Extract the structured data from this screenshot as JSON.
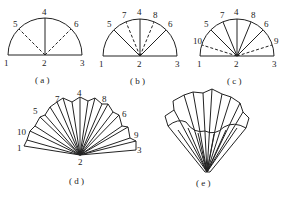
{
  "figure": {
    "panels": [
      {
        "id": "a",
        "caption": "( a )",
        "points": [
          "1",
          "2",
          "3",
          "4",
          "5",
          "6"
        ]
      },
      {
        "id": "b",
        "caption": "( b )",
        "points": [
          "1",
          "2",
          "3",
          "4",
          "5",
          "6",
          "7",
          "8"
        ]
      },
      {
        "id": "c",
        "caption": "( c )",
        "points": [
          "1",
          "2",
          "3",
          "4",
          "5",
          "6",
          "7",
          "8",
          "9",
          "10"
        ]
      },
      {
        "id": "d",
        "caption": "( d )",
        "points": [
          "1",
          "2",
          "3",
          "4",
          "5",
          "6",
          "7",
          "8",
          "9",
          "10"
        ]
      },
      {
        "id": "e",
        "caption": "( e )"
      }
    ],
    "labels": {
      "a": {
        "p1": "1",
        "p2": "2",
        "p3": "3",
        "p4": "4",
        "p5": "5",
        "p6": "6"
      },
      "b": {
        "p1": "1",
        "p2": "2",
        "p3": "3",
        "p4": "4",
        "p5": "5",
        "p6": "6",
        "p7": "7",
        "p8": "8"
      },
      "c": {
        "p1": "1",
        "p2": "2",
        "p3": "3",
        "p4": "4",
        "p5": "5",
        "p6": "6",
        "p7": "7",
        "p8": "8",
        "p9": "9",
        "p10": "10"
      },
      "d": {
        "p1": "1",
        "p2": "2",
        "p3": "3",
        "p4": "4",
        "p5": "5",
        "p6": "6",
        "p7": "7",
        "p8": "8",
        "p9": "9",
        "p10": "10"
      }
    },
    "captions": {
      "a": "( a )",
      "b": "( b )",
      "c": "( c )",
      "d": "( d )",
      "e": "( e )"
    }
  }
}
